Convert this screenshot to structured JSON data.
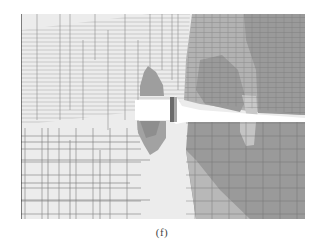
{
  "figure": {
    "caption": "(f)",
    "colors": {
      "background": "#ffffff",
      "level_1_lightest": "#ececec",
      "level_2": "#d8d8d8",
      "level_3": "#b4b4b4",
      "level_4": "#9a9a9a",
      "level_5_darkest": "#8a8a8a",
      "mesh_lines": "#6e6e6e"
    },
    "frame": {
      "x": 21,
      "y": 14,
      "width": 284,
      "height": 205
    }
  }
}
